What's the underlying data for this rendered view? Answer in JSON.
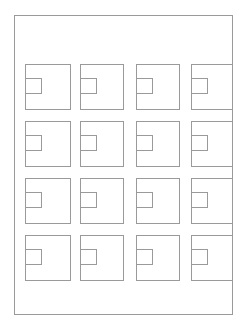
{
  "diagram": {
    "type": "grid-of-nested-squares",
    "rows": 4,
    "columns": 4,
    "line_color": "#9a9a9a",
    "background_color": "#ffffff",
    "frame": {
      "left": 14,
      "top": 15,
      "right": 233,
      "bottom": 315
    },
    "column_x": [
      25,
      80,
      136,
      191
    ],
    "column_widths": [
      46,
      44,
      44,
      46
    ],
    "row_y": [
      64,
      121,
      178,
      235
    ],
    "cell_height": 46,
    "inner_square": {
      "offset_x": 0,
      "offset_y": 14,
      "width": 17,
      "height": 16
    }
  }
}
